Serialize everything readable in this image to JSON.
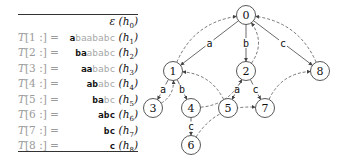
{
  "table": {
    "rows": [
      {
        "lhs_T": "",
        "lhs_rest": "",
        "prefix": "",
        "suffix": "",
        "epsilon": "ε",
        "h_base": "(h",
        "h_sub": "0",
        "h_close": ")"
      },
      {
        "lhs_T": "T",
        "lhs_rest": "[1 :] =",
        "prefix": "a",
        "suffix": "baababc",
        "epsilon": "",
        "h_base": "(h",
        "h_sub": "1",
        "h_close": ")"
      },
      {
        "lhs_T": "T",
        "lhs_rest": "[2 :] =",
        "prefix": "ba",
        "suffix": "ababc",
        "epsilon": "",
        "h_base": "(h",
        "h_sub": "2",
        "h_close": ")"
      },
      {
        "lhs_T": "T",
        "lhs_rest": "[3 :] =",
        "prefix": "aa",
        "suffix": "babc",
        "epsilon": "",
        "h_base": "(h",
        "h_sub": "3",
        "h_close": ")"
      },
      {
        "lhs_T": "T",
        "lhs_rest": "[4 :] =",
        "prefix": "ab",
        "suffix": "abc",
        "epsilon": "",
        "h_base": "(h",
        "h_sub": "4",
        "h_close": ")"
      },
      {
        "lhs_T": "T",
        "lhs_rest": "[5 :] =",
        "prefix": "ba",
        "suffix": "bc",
        "epsilon": "",
        "h_base": "(h",
        "h_sub": "5",
        "h_close": ")"
      },
      {
        "lhs_T": "T",
        "lhs_rest": "[6 :] =",
        "prefix": "abc",
        "suffix": "",
        "epsilon": "",
        "h_base": "(h",
        "h_sub": "6",
        "h_close": ")"
      },
      {
        "lhs_T": "T",
        "lhs_rest": "[7 :] =",
        "prefix": "bc",
        "suffix": "",
        "epsilon": "",
        "h_base": "(h",
        "h_sub": "7",
        "h_close": ")"
      },
      {
        "lhs_T": "T",
        "lhs_rest": "[8 :] =",
        "prefix": "c",
        "suffix": "",
        "epsilon": "",
        "h_base": "(h",
        "h_sub": "8",
        "h_close": ")"
      }
    ]
  },
  "graph": {
    "nodes": [
      {
        "id": "0",
        "x": 246,
        "y": 15
      },
      {
        "id": "1",
        "x": 173,
        "y": 71
      },
      {
        "id": "2",
        "x": 246,
        "y": 71
      },
      {
        "id": "8",
        "x": 320,
        "y": 71
      },
      {
        "id": "3",
        "x": 153,
        "y": 108
      },
      {
        "id": "4",
        "x": 191,
        "y": 108
      },
      {
        "id": "5",
        "x": 228,
        "y": 108
      },
      {
        "id": "7",
        "x": 265,
        "y": 108
      },
      {
        "id": "6",
        "x": 191,
        "y": 145
      }
    ],
    "edges": [
      {
        "from": "0",
        "to": "1",
        "label": "a"
      },
      {
        "from": "0",
        "to": "2",
        "label": "b"
      },
      {
        "from": "0",
        "to": "8",
        "label": "c"
      },
      {
        "from": "1",
        "to": "3",
        "label": "a"
      },
      {
        "from": "1",
        "to": "4",
        "label": "b"
      },
      {
        "from": "2",
        "to": "5",
        "label": "a"
      },
      {
        "from": "2",
        "to": "7",
        "label": "c"
      },
      {
        "from": "4",
        "to": "6",
        "label": "c"
      }
    ],
    "suffix_links": [
      {
        "from": "1",
        "to": "0"
      },
      {
        "from": "2",
        "to": "0"
      },
      {
        "from": "8",
        "to": "0"
      },
      {
        "from": "3",
        "to": "1"
      },
      {
        "from": "4",
        "to": "2"
      },
      {
        "from": "5",
        "to": "1"
      },
      {
        "from": "6",
        "to": "7"
      },
      {
        "from": "7",
        "to": "8"
      }
    ]
  }
}
